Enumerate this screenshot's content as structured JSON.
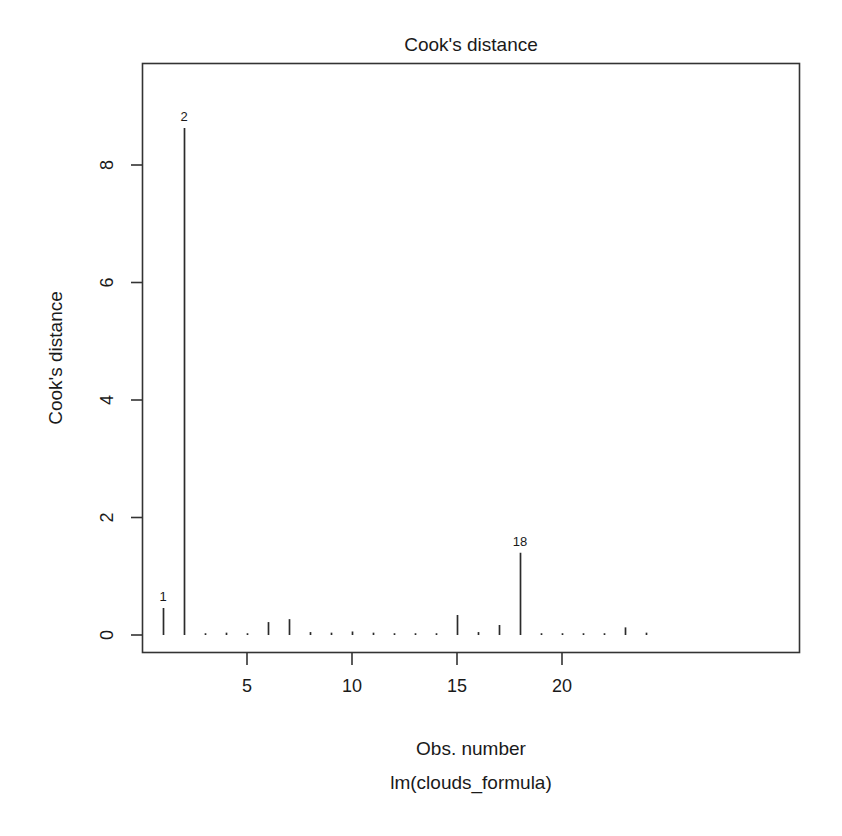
{
  "chart_data": {
    "type": "bar",
    "title": "Cook's distance",
    "xlabel": "Obs. number",
    "sublabel": "lm(clouds_formula)",
    "ylabel": "Cook's distance",
    "x": [
      1,
      2,
      3,
      4,
      5,
      6,
      7,
      8,
      9,
      10,
      11,
      12,
      13,
      14,
      15,
      16,
      17,
      18,
      19,
      20,
      21,
      22,
      23,
      24
    ],
    "values": [
      0.46,
      8.63,
      0.03,
      0.04,
      0.03,
      0.22,
      0.27,
      0.05,
      0.04,
      0.06,
      0.04,
      0.03,
      0.03,
      0.03,
      0.34,
      0.05,
      0.17,
      1.4,
      0.03,
      0.03,
      0.03,
      0.03,
      0.13,
      0.04
    ],
    "categories": [
      "1",
      "2",
      "3",
      "4",
      "5",
      "6",
      "7",
      "8",
      "9",
      "10",
      "11",
      "12",
      "13",
      "14",
      "15",
      "16",
      "17",
      "18",
      "19",
      "20",
      "21",
      "22",
      "23",
      "24"
    ],
    "xlim": [
      0.5,
      24.5
    ],
    "ylim": [
      0,
      9.2
    ],
    "xticks": [
      5,
      10,
      15,
      20
    ],
    "xtick_labels": [
      "5",
      "10",
      "15",
      "20"
    ],
    "yticks": [
      0,
      2,
      4,
      6,
      8
    ],
    "ytick_labels": [
      "0",
      "2",
      "4",
      "6",
      "8"
    ],
    "grid": false,
    "legend": "none",
    "annotations": [
      {
        "label": "1",
        "x": 1,
        "y": 0.46
      },
      {
        "label": "2",
        "x": 2,
        "y": 8.63
      },
      {
        "label": "18",
        "x": 18,
        "y": 1.4
      }
    ],
    "series_color": "#2b2b2b",
    "axis_color": "#333333",
    "background_color": "#ffffff"
  }
}
